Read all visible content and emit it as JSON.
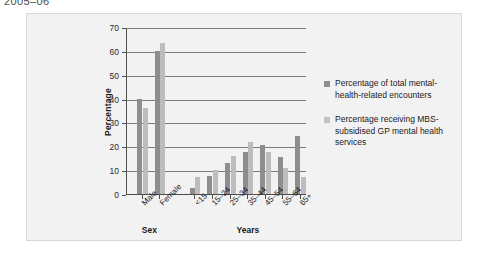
{
  "caption": "2005–06",
  "chart_data": {
    "type": "bar",
    "title": "",
    "xlabel": "",
    "ylabel": "Percentage",
    "ylim": [
      0,
      70
    ],
    "yticks": [
      0,
      10,
      20,
      30,
      40,
      50,
      60,
      70
    ],
    "ytick_labels": [
      "0",
      "10",
      "20",
      "30",
      "40",
      "50",
      "60",
      "70"
    ],
    "grid": true,
    "legend_position": "right",
    "axis_groups": [
      {
        "name": "Sex",
        "categories": [
          "Male",
          "Female"
        ]
      },
      {
        "name": "Years",
        "categories": [
          "<15",
          "15–24",
          "25–34",
          "35–44",
          "45–54",
          "55–64",
          "65+"
        ]
      }
    ],
    "categories": [
      "Male",
      "Female",
      "<15",
      "15–24",
      "25–34",
      "35–44",
      "45–54",
      "55–64",
      "65+"
    ],
    "series": [
      {
        "name": "Percentage of total mental-health-related encounters",
        "color": "#8e8e8e",
        "values": [
          40.0,
          60.0,
          2.5,
          7.5,
          13.0,
          17.5,
          20.5,
          15.5,
          24.5
        ]
      },
      {
        "name": "Percentage receiving MBS-subsidised GP mental health services",
        "color": "#bdbdbd",
        "values": [
          36.0,
          63.5,
          7.0,
          10.0,
          16.0,
          22.0,
          17.5,
          11.0,
          7.0
        ]
      }
    ]
  },
  "legend": {
    "items": [
      {
        "label": "Percentage of total mental-health-related encounters",
        "swatch": "#8e8e8e"
      },
      {
        "label": "Percentage receiving MBS-subsidised GP mental health services",
        "swatch": "#c2c2c2"
      }
    ]
  }
}
